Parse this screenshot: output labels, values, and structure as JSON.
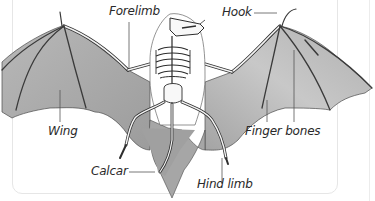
{
  "diagram": {
    "labels": {
      "forelimb": "Forelimb",
      "hook": "Hook",
      "wing": "Wing",
      "finger_bones": "Finger bones",
      "calcar": "Calcar",
      "hind_limb": "Hind limb"
    },
    "colors": {
      "membrane": "#a9a9a9",
      "membrane_light": "#cfcfcf",
      "bone": "#f4f4f4",
      "outline": "#3a3a3a",
      "leader_line": "#555555",
      "frame_border": "#e6e6e6"
    }
  }
}
